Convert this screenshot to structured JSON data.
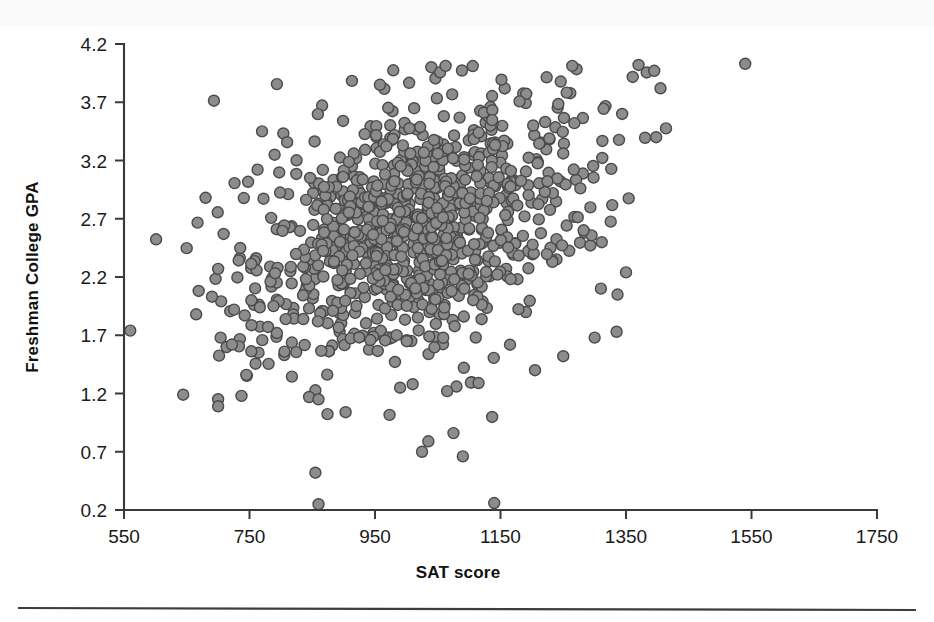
{
  "figure": {
    "name": "sat-gpa-scatterplot",
    "background": "#ffffff",
    "marker_fill": "#8c8c8c",
    "marker_stroke": "#4a4a4a",
    "axis_color": "#3a3a3a",
    "footer_rule_color": "#3d3d3d"
  },
  "chart_data": {
    "type": "scatter",
    "title": "",
    "xlabel": "SAT score",
    "ylabel": "Freshman College GPA",
    "xlim": [
      550,
      1750
    ],
    "ylim": [
      0.2,
      4.2
    ],
    "xticks": [
      550,
      750,
      950,
      1150,
      1350,
      1550,
      1750
    ],
    "xtick_labels": [
      "550",
      "750",
      "950",
      "1150",
      "1350",
      "1550",
      "1750"
    ],
    "yticks": [
      0.2,
      0.7,
      1.2,
      1.7,
      2.2,
      2.7,
      3.2,
      3.7,
      4.2
    ],
    "ytick_labels": [
      "0.2",
      "0.7",
      "1.2",
      "1.7",
      "2.2",
      "2.7",
      "3.2",
      "3.7",
      "4.2"
    ],
    "grid": false,
    "legend": null,
    "legend_position": "none",
    "marker": "circle",
    "marker_size": 11,
    "n_points": 1000,
    "correlation_note": "positive association with ceiling effect near GPA 4.0",
    "distribution": {
      "x_mean": 1010,
      "x_sd": 135,
      "y_mean": 2.62,
      "y_sd": 0.56,
      "rho": 0.42,
      "y_ceiling": 4.02,
      "y_floor": 0.22,
      "x_min_clip": 560,
      "x_max_clip": 1420
    },
    "outliers": [
      {
        "x": 560,
        "y": 1.74
      },
      {
        "x": 1540,
        "y": 4.03
      },
      {
        "x": 860,
        "y": 0.25
      },
      {
        "x": 1140,
        "y": 0.26
      },
      {
        "x": 855,
        "y": 0.52
      },
      {
        "x": 1035,
        "y": 0.79
      },
      {
        "x": 1025,
        "y": 0.7
      },
      {
        "x": 1075,
        "y": 0.86
      },
      {
        "x": 1090,
        "y": 0.66
      },
      {
        "x": 700,
        "y": 1.09
      },
      {
        "x": 745,
        "y": 1.36
      },
      {
        "x": 845,
        "y": 1.17
      },
      {
        "x": 860,
        "y": 1.15
      },
      {
        "x": 990,
        "y": 1.25
      },
      {
        "x": 1010,
        "y": 1.28
      },
      {
        "x": 1065,
        "y": 1.22
      },
      {
        "x": 1115,
        "y": 1.29
      },
      {
        "x": 1370,
        "y": 4.02
      },
      {
        "x": 1395,
        "y": 3.97
      },
      {
        "x": 1405,
        "y": 3.82
      },
      {
        "x": 1310,
        "y": 2.1
      },
      {
        "x": 1335,
        "y": 1.73
      },
      {
        "x": 1300,
        "y": 1.68
      },
      {
        "x": 1250,
        "y": 1.52
      },
      {
        "x": 1205,
        "y": 1.4
      },
      {
        "x": 680,
        "y": 2.88
      },
      {
        "x": 665,
        "y": 1.88
      },
      {
        "x": 700,
        "y": 2.27
      },
      {
        "x": 770,
        "y": 3.45
      },
      {
        "x": 790,
        "y": 3.25
      }
    ]
  },
  "footer": {
    "rule_visible": true
  }
}
